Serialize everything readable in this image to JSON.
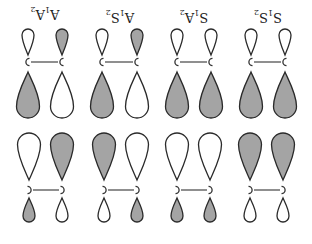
{
  "figure": {
    "orientation_deg": 180,
    "colors": {
      "shaded": "#a4a4a4",
      "unshaded": "#ffffff",
      "outline": "#2a2a2a"
    },
    "top_row": [
      {
        "label": "A₁A₂",
        "label_main1": "A",
        "label_sub1": "1",
        "label_main2": "A",
        "label_sub2": "2",
        "cx": 45,
        "atoms_x": [
          28,
          62
        ],
        "small": [
          "white",
          "gray"
        ],
        "large": [
          "gray",
          "white"
        ]
      },
      {
        "label": "A₁S₂",
        "label_main1": "A",
        "label_sub1": "1",
        "label_main2": "S",
        "label_sub2": "2",
        "cx": 120,
        "atoms_x": [
          102,
          137
        ],
        "small": [
          "white",
          "gray"
        ],
        "large": [
          "gray",
          "white"
        ]
      },
      {
        "label": "S₁A₂",
        "label_main1": "S",
        "label_sub1": "1",
        "label_main2": "A",
        "label_sub2": "2",
        "cx": 194,
        "atoms_x": [
          177,
          211
        ],
        "small": [
          "white",
          "white"
        ],
        "large": [
          "gray",
          "gray"
        ]
      },
      {
        "label": "S₁S₂",
        "label_main1": "S",
        "label_sub1": "1",
        "label_main2": "S",
        "label_sub2": "2",
        "cx": 268,
        "atoms_x": [
          251,
          285
        ],
        "small": [
          "white",
          "white"
        ],
        "large": [
          "gray",
          "gray"
        ]
      }
    ],
    "bottom_row": [
      {
        "atoms_x": [
          29,
          62
        ],
        "large": [
          "white",
          "gray"
        ],
        "small": [
          "gray",
          "white"
        ]
      },
      {
        "atoms_x": [
          104,
          137
        ],
        "large": [
          "gray",
          "white"
        ],
        "small": [
          "white",
          "gray"
        ]
      },
      {
        "atoms_x": [
          177,
          210
        ],
        "large": [
          "white",
          "white"
        ],
        "small": [
          "gray",
          "gray"
        ]
      },
      {
        "atoms_x": [
          250,
          283
        ],
        "large": [
          "gray",
          "gray"
        ],
        "small": [
          "white",
          "white"
        ]
      }
    ],
    "atom_symbol": "C"
  }
}
